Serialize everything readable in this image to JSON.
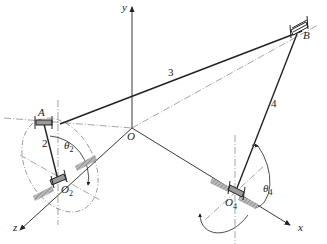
{
  "diagram": {
    "type": "spatial four-bar linkage (RSSR mechanism)",
    "axes": {
      "x": {
        "label": "x"
      },
      "y": {
        "label": "y"
      },
      "z": {
        "label": "z"
      },
      "origin": {
        "label": "O"
      }
    },
    "points": [
      {
        "id": "A",
        "label": "A"
      },
      {
        "id": "B",
        "label": "B"
      },
      {
        "id": "O2",
        "label": "O",
        "subscript": "2"
      },
      {
        "id": "O4",
        "label": "O",
        "subscript": "4"
      }
    ],
    "links": [
      {
        "id": "2",
        "label": "2",
        "from": "O2",
        "to": "A"
      },
      {
        "id": "3",
        "label": "3",
        "from": "A",
        "to": "B"
      },
      {
        "id": "4",
        "label": "4",
        "from": "O4",
        "to": "B"
      }
    ],
    "angles": [
      {
        "id": "theta2",
        "label": "θ",
        "subscript": "2"
      },
      {
        "id": "theta4",
        "label": "θ",
        "subscript": "4"
      }
    ],
    "colors": {
      "line": "#222222",
      "centerline": "#666666",
      "hatch": "#888888"
    }
  }
}
